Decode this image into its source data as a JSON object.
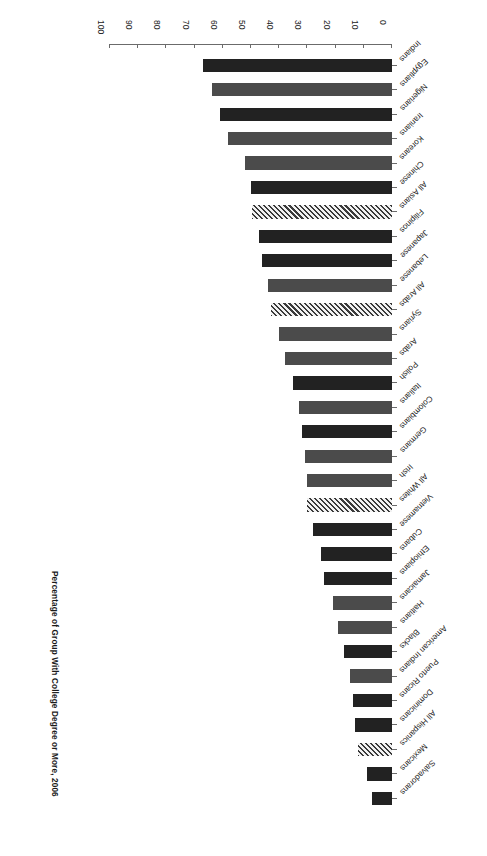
{
  "chart_data": {
    "type": "bar",
    "orientation": "horizontal",
    "title": "Percentage of Group With College Degree or More, 2006",
    "xlabel": "Percentage",
    "ylabel": "",
    "xlim": [
      0,
      100
    ],
    "xticks": [
      0,
      10,
      20,
      30,
      40,
      50,
      60,
      70,
      80,
      90,
      100
    ],
    "grid": false,
    "legend": null,
    "categories": [
      "Indians",
      "Egyptians",
      "Nigerians",
      "Iranians",
      "Koreans",
      "Chinese",
      "All Asians",
      "Filipinos",
      "Japanese",
      "Lebanese",
      "All Arabs",
      "Syrians",
      "Arabs",
      "Polish",
      "Italians",
      "Colombians",
      "Germans",
      "Irish",
      "All Whites",
      "Vietnamese",
      "Cubans",
      "Ethiopians",
      "Jamaicans",
      "Haitians",
      "Blacks",
      "American Indians",
      "Puerto Ricans",
      "Dominicans",
      "All Hispanics",
      "Mexicans",
      "Salvadorans"
    ],
    "values": [
      67.0,
      64.0,
      61.0,
      58.0,
      52.0,
      50.0,
      49.5,
      47.0,
      46.0,
      44.0,
      43.0,
      40.0,
      38.0,
      35.0,
      33.0,
      32.0,
      31.0,
      30.0,
      30.0,
      28.0,
      25.0,
      24.0,
      21.0,
      19.0,
      17.0,
      15.0,
      14.0,
      13.0,
      12.0,
      9.0,
      7.0
    ],
    "bar_styles": [
      "dark",
      "mid",
      "dark",
      "mid",
      "mid",
      "dark",
      "hatch",
      "dark",
      "dark",
      "mid",
      "hatch",
      "mid",
      "mid",
      "dark",
      "mid",
      "dark",
      "mid",
      "mid",
      "hatch",
      "dark",
      "dark",
      "dark",
      "mid",
      "mid",
      "dark",
      "mid",
      "dark",
      "dark",
      "hatch",
      "dark",
      "dark"
    ]
  },
  "axis": {
    "tick_labels": [
      "0",
      "10",
      "20",
      "30",
      "40",
      "50",
      "60",
      "70",
      "80",
      "90",
      "100"
    ],
    "axis_title": "Percentage"
  }
}
